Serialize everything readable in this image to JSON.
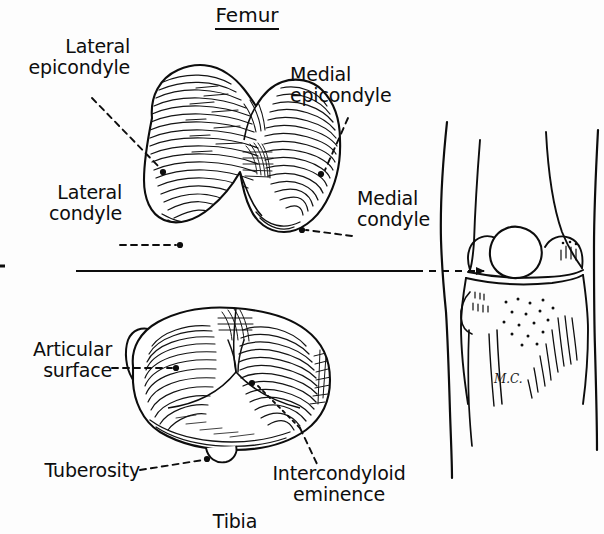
{
  "figure": {
    "kind": "anatomical-illustration",
    "background_color": "#fdfdfd",
    "ink_color": "#0d0d0d"
  },
  "titles": {
    "femur": "Femur",
    "tibia": "Tibia"
  },
  "labels": {
    "lateral_epicondyle": {
      "line1": "Lateral",
      "line2": "epicondyle"
    },
    "medial_epicondyle": {
      "line1": "Medial",
      "line2": "epicondyle"
    },
    "lateral_condyle": {
      "line1": "Lateral",
      "line2": "condyle"
    },
    "medial_condyle": {
      "line1": "Medial",
      "line2": "condyle"
    },
    "articular_surface": {
      "line1": "Articular",
      "line2": "surface"
    },
    "tuberosity": {
      "line1": "Tuberosity"
    },
    "intercondyloid_eminence": {
      "line1": "Intercondyloid",
      "line2": "eminence"
    }
  },
  "signature": {
    "text": "M.C."
  },
  "panels": {
    "left_top": "femur-distal-end-inferior-view",
    "left_bottom": "tibia-superior-plateau-view",
    "right": "knee-anterior-view-with-patella"
  }
}
